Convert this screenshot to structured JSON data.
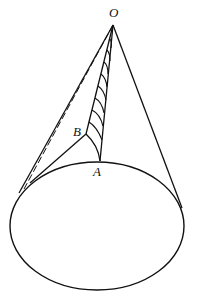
{
  "diagram": {
    "type": "cone-geometry",
    "labels": {
      "apex": "O",
      "point_a": "A",
      "point_b": "B"
    },
    "colors": {
      "stroke": "#111111",
      "background": "#ffffff"
    }
  }
}
